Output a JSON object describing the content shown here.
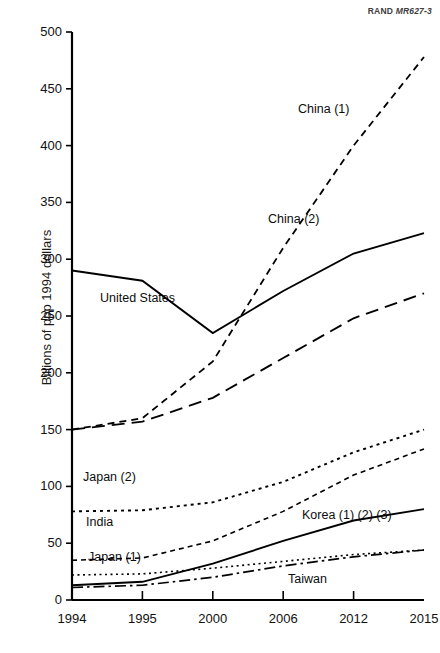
{
  "source_note": {
    "prefix": "RAND ",
    "code": "MR627-3"
  },
  "chart_data": {
    "type": "line",
    "title": "",
    "subtitle": "",
    "xlabel": "",
    "ylabel": "Billions of ppp 1994 dollars",
    "categories": [
      "1994",
      "1995",
      "2000",
      "2006",
      "2012",
      "2015"
    ],
    "x": [
      1994,
      1995,
      2000,
      2006,
      2012,
      2015
    ],
    "xtick_labels": [
      "1994",
      "1995",
      "2000",
      "2006",
      "2012",
      "2015"
    ],
    "ytick_labels": [
      "0",
      "50",
      "100",
      "150",
      "200",
      "250",
      "300",
      "350",
      "400",
      "450",
      "500"
    ],
    "ylim": [
      0,
      500
    ],
    "ytick_values": [
      0,
      50,
      100,
      150,
      200,
      250,
      300,
      350,
      400,
      450,
      500
    ],
    "grid": false,
    "legend_position": "inline-labels",
    "axis_style": "categorical-even-spacing",
    "series": [
      {
        "name": "United States",
        "label": "United States",
        "style": "solid",
        "values": [
          290,
          281,
          235,
          272,
          305,
          323
        ],
        "label_x": 100,
        "label_y": 292
      },
      {
        "name": "China (1)",
        "label": "China (1)",
        "style": "dashed-short",
        "values": [
          150,
          160,
          210,
          310,
          400,
          478
        ],
        "label_x": 298,
        "label_y": 103
      },
      {
        "name": "China (2)",
        "label": "China (2)",
        "style": "dashed-long",
        "values": [
          150,
          157,
          178,
          213,
          248,
          270
        ],
        "label_x": 268,
        "label_y": 213
      },
      {
        "name": "Japan (2)",
        "label": "Japan (2)",
        "style": "dotted",
        "values": [
          78,
          79,
          86,
          104,
          130,
          150
        ],
        "label_x": 83,
        "label_y": 471
      },
      {
        "name": "India",
        "label": "India",
        "style": "dashed-fine",
        "values": [
          35,
          37,
          52,
          78,
          110,
          133
        ],
        "label_x": 86,
        "label_y": 516
      },
      {
        "name": "Japan (1)",
        "label": "Japan (1)",
        "style": "dotted-fine",
        "values": [
          22,
          23,
          28,
          34,
          40,
          44
        ],
        "label_x": 88,
        "label_y": 551
      },
      {
        "name": "Korea (1) (2) (3)",
        "label": "Korea (1) (2) (3)",
        "style": "solid",
        "values": [
          13,
          16,
          32,
          52,
          70,
          80
        ],
        "label_x": 302,
        "label_y": 509
      },
      {
        "name": "Taiwan",
        "label": "Taiwan",
        "style": "dash-dot",
        "values": [
          11,
          13,
          20,
          30,
          38,
          44
        ],
        "label_x": 288,
        "label_y": 573
      }
    ]
  }
}
